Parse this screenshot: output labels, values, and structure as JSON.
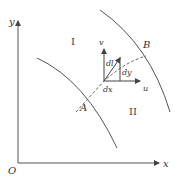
{
  "diagram": {
    "axes": {
      "x_label": "x",
      "y_label": "y",
      "origin_label": "O"
    },
    "curves": [
      {
        "label": "A",
        "style": "solid"
      },
      {
        "label": "B",
        "style": "solid"
      }
    ],
    "regions": [
      {
        "label": "I"
      },
      {
        "label": "II"
      }
    ],
    "connector": {
      "style": "dashed",
      "description": "line linking curve A and curve B through the vector origin"
    },
    "vectors": {
      "v_label": "v",
      "u_label": "u",
      "dl_label": "dl",
      "dx_label": "dx",
      "dy_label": "dy"
    },
    "colors": {
      "line": "#555555",
      "text": "#333333",
      "background": "#ffffff"
    }
  }
}
